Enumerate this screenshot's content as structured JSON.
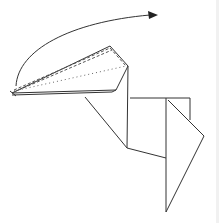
{
  "diagram": {
    "title": "",
    "type": "origami fold instruction",
    "colors": {
      "line": "#333333",
      "background": "#ffffff"
    },
    "elements": [
      {
        "name": "fold-arrow",
        "kind": "curved arrow",
        "direction": "clockwise over top"
      },
      {
        "name": "pleat-flap",
        "kind": "folded flap with valley-fold dashed line and dotted hidden edge"
      },
      {
        "name": "body",
        "kind": "paper outline"
      }
    ]
  }
}
